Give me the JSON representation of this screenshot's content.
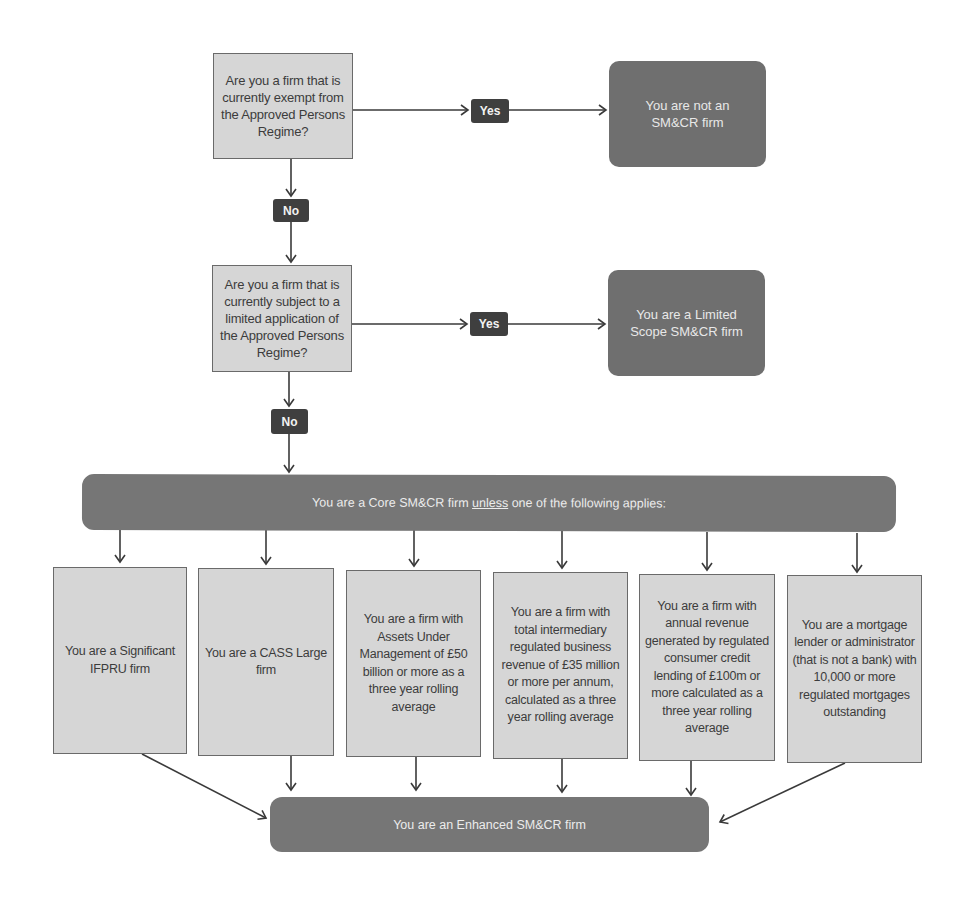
{
  "flowchart": {
    "question_1": {
      "text": "Are you a firm that is currently exempt from the Approved Persons Regime?",
      "yes_label": "Yes",
      "no_label": "No",
      "yes_result": "You are not an SM&CR firm"
    },
    "question_2": {
      "text": "Are you a firm that is currently subject to a limited application of the Approved Persons Regime?",
      "yes_label": "Yes",
      "no_label": "No",
      "yes_result": "You are a Limited Scope SM&CR firm"
    },
    "core_banner": {
      "prefix": "You are a Core SM&CR firm ",
      "emphasis": "unless",
      "suffix": " one of the following applies:"
    },
    "criteria": [
      {
        "text": "You are a Significant IFPRU firm"
      },
      {
        "text": "You are a CASS Large firm"
      },
      {
        "text": "You are a firm with Assets Under Management of £50 billion or more as a three year rolling average"
      },
      {
        "text": "You are a firm with total intermediary regulated business revenue of £35 million or more per annum, calculated as a three year rolling average"
      },
      {
        "text": "You are a firm with annual revenue generated by regulated consumer credit lending of £100m or more calculated as a three year rolling average"
      },
      {
        "text": "You are a mortgage lender or administrator (that is not a bank) with 10,000 or more regulated mortgages outstanding"
      }
    ],
    "enhanced_result": "You are an Enhanced SM&CR firm"
  },
  "colors": {
    "question_fill": "#d6d6d6",
    "result_fill": "#6f6f6f",
    "badge_fill": "#3f3f3f",
    "line": "#3a3a3a"
  }
}
